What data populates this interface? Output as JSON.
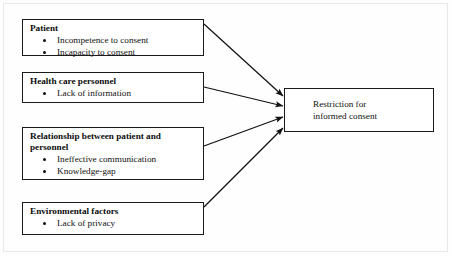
{
  "figure": {
    "type": "flow-diagram",
    "direction": "left-to-right converging",
    "background_color": "#ffffff",
    "line_color": "#1a1a1a"
  },
  "factor_boxes": [
    {
      "id": "patient",
      "title": "Patient",
      "bullets": [
        "Incompetence to consent",
        "Incapacity to consent"
      ]
    },
    {
      "id": "health-care-personnel",
      "title": "Health care personnel",
      "bullets": [
        "Lack of information"
      ]
    },
    {
      "id": "relationship-between-patient-and-personnel",
      "title": "Relationship between patient and personnel",
      "bullets": [
        "Ineffective communication",
        "Knowledge-gap"
      ]
    },
    {
      "id": "environmental-factors",
      "title": "Environmental factors",
      "bullets": [
        "Lack of privacy"
      ]
    }
  ],
  "target_box": {
    "id": "restriction-for-informed-consent",
    "line1": "Restriction for",
    "line2": "informed consent"
  },
  "connections": [
    {
      "from": "patient",
      "to": "restriction-for-informed-consent",
      "style": "arrow"
    },
    {
      "from": "health-care-personnel",
      "to": "restriction-for-informed-consent",
      "style": "arrow"
    },
    {
      "from": "relationship-between-patient-and-personnel",
      "to": "restriction-for-informed-consent",
      "style": "arrow"
    },
    {
      "from": "environmental-factors",
      "to": "restriction-for-informed-consent",
      "style": "arrow"
    }
  ]
}
